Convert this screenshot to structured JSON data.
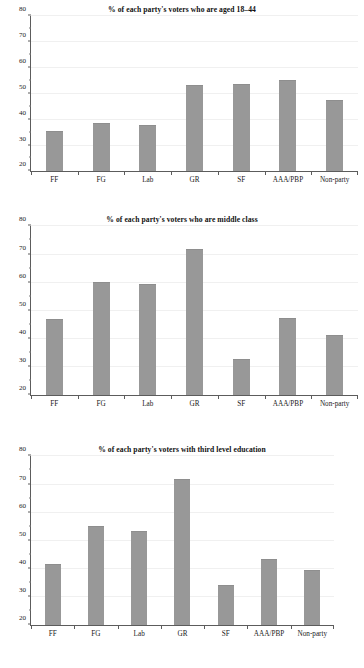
{
  "figure": {
    "background": "#ffffff",
    "bar_color": "#989898",
    "axis_color": "#5c5c5c",
    "grid_color": "#f0f0f0"
  },
  "chart_data": [
    {
      "type": "bar",
      "title": "% of each party's voters who are aged 18–44",
      "xlabel": "",
      "ylabel": "",
      "categories": [
        "FF",
        "FG",
        "Lab",
        "GR",
        "SF",
        "AAA/PBP",
        "Non-party"
      ],
      "values": [
        35.2,
        38.2,
        37.6,
        53.2,
        53.5,
        55.0,
        47.2
      ],
      "ylim": [
        20,
        80
      ],
      "yticks": [
        20,
        30,
        40,
        50,
        60,
        70,
        80
      ],
      "ytick_labels": [
        "20",
        "30",
        "40",
        "50",
        "60",
        "70",
        "80"
      ],
      "grid": true,
      "legend": false
    },
    {
      "type": "bar",
      "title": "% of each party's voters who are middle class",
      "xlabel": "",
      "ylabel": "",
      "categories": [
        "FF",
        "FG",
        "Lab",
        "GR",
        "SF",
        "AAA/PBP",
        "Non-party"
      ],
      "values": [
        46.6,
        59.8,
        59.1,
        71.5,
        32.5,
        47.0,
        41.2
      ],
      "ylim": [
        20,
        80
      ],
      "yticks": [
        20,
        30,
        40,
        50,
        60,
        70,
        80
      ],
      "ytick_labels": [
        "20",
        "30",
        "40",
        "50",
        "60",
        "70",
        "80"
      ],
      "grid": true,
      "legend": false
    },
    {
      "type": "bar",
      "title": "% of each party's voters with third level education",
      "xlabel": "",
      "ylabel": "",
      "categories": [
        "FF",
        "FG",
        "Lab",
        "GR",
        "SF",
        "AAA/PBP",
        "Non-party"
      ],
      "values": [
        41.3,
        55.0,
        53.0,
        71.7,
        34.0,
        43.2,
        39.2
      ],
      "ylim": [
        20,
        80
      ],
      "yticks": [
        20,
        30,
        40,
        50,
        60,
        70,
        80
      ],
      "ytick_labels": [
        "20",
        "30",
        "40",
        "50",
        "60",
        "70",
        "80"
      ],
      "grid": true,
      "legend": false
    }
  ]
}
